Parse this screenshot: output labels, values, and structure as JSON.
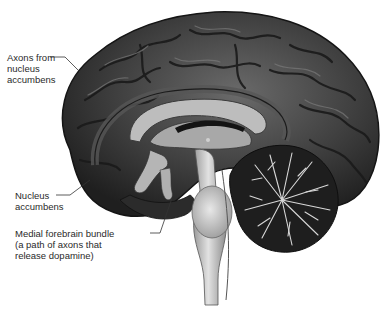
{
  "figure": {
    "labels": [
      {
        "id": "axons",
        "lines": [
          "Axons from",
          "nucleus",
          "accumbens"
        ]
      },
      {
        "id": "nucleus",
        "lines": [
          "Nucleus",
          "accumbens"
        ]
      },
      {
        "id": "mfb",
        "lines": [
          "Medial forebrain bundle",
          "(a path of axons that",
          "release dopamine)"
        ]
      }
    ]
  },
  "colors": {
    "cortex": "#3a3a3a",
    "gyri_highlight": "#5e5e5e",
    "corpus_callosum": "#bdbdbd",
    "brainstem": "#cfcfcf",
    "cerebellum": "#1e1e1e",
    "cerebellum_branches": "#d8d8d8",
    "leader_line": "#333333"
  }
}
